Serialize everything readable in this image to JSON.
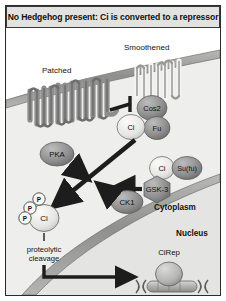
{
  "title": "No Hedgehog present: Ci is converted to a repressor",
  "compartments": {
    "extracellular_label": "",
    "cytoplasm_label": "Cytoplasm",
    "nucleus_label": "Nucleus"
  },
  "receptors": [
    {
      "id": "patched",
      "label": "Patched",
      "type": "multipass-receptor",
      "passes": 12,
      "fill": "#8d8d8d"
    },
    {
      "id": "smoothened",
      "label": "Smoothened",
      "type": "seven-pass-receptor",
      "passes": 7,
      "fill": "#f2f2f0"
    }
  ],
  "complex": {
    "name": "Cos2-Ci-Fu complex",
    "members": [
      {
        "id": "cos2",
        "label": "Cos2",
        "fill": "#8f8f8f"
      },
      {
        "id": "ci-complex",
        "label": "Ci",
        "fill": "#ebebe8"
      },
      {
        "id": "fu",
        "label": "Fu",
        "fill": "#8f8f8f"
      }
    ]
  },
  "sufu_pair": [
    {
      "id": "ci-sufu",
      "label": "Ci",
      "fill": "#ebebe8"
    },
    {
      "id": "sufu",
      "label": "Su(fu)",
      "fill": "#8f8f8f"
    }
  ],
  "kinases": [
    {
      "id": "pka",
      "label": "PKA",
      "shape": "ellipse",
      "fill": "#9a9a9a"
    },
    {
      "id": "gsk3",
      "label": "GSK-3",
      "shape": "hexagon",
      "fill": "#9a9a9a"
    },
    {
      "id": "ck1",
      "label": "CK1",
      "shape": "ellipse",
      "fill": "#9a9a9a"
    }
  ],
  "phospho_ci": {
    "label": "Ci",
    "phosphate_label": "P",
    "phosphate_count": 3,
    "fill": "#ebebe8"
  },
  "cleavage": {
    "line1": "proteolytic",
    "line2": "cleavage"
  },
  "repressor": {
    "label": "CiRep",
    "fill": "#b4b4b2"
  },
  "interactions": [
    {
      "from": "patched",
      "to": "smoothened",
      "kind": "inhibition"
    },
    {
      "from": "pka",
      "to": "ci",
      "kind": "activation"
    },
    {
      "from": "gsk3",
      "to": "ci",
      "kind": "activation"
    },
    {
      "from": "ck1",
      "to": "ci",
      "kind": "activation"
    },
    {
      "from": "complex",
      "to": "phospho_ci",
      "kind": "conversion"
    },
    {
      "from": "phospho_ci",
      "to": "repressor",
      "kind": "translocation"
    }
  ],
  "colors": {
    "outline": "#2b2b2b",
    "membrane": "#9e9e9c",
    "cytoplasm": "#eeeeec",
    "nucleus": "#e4e4e2",
    "extracellular": "#ffffff",
    "arrow": "#1d1d1d",
    "title_bg": "#e2e2e0"
  }
}
